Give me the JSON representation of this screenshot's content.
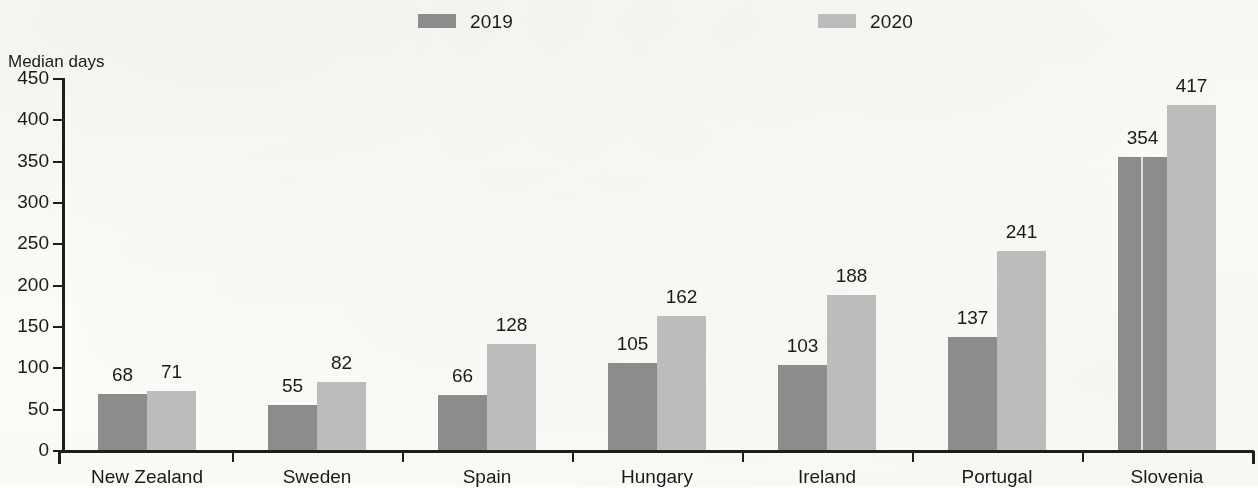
{
  "legend": {
    "entries": [
      {
        "label": "2019",
        "color": "#8c8c8c",
        "x": 418
      },
      {
        "label": "2020",
        "color": "#bcbcbc",
        "x": 818
      }
    ]
  },
  "axis": {
    "y_title": "Median days"
  },
  "chart_data": {
    "type": "bar",
    "title": "",
    "subtitle": "",
    "xlabel": "",
    "ylabel": "Median days",
    "ylim": [
      0,
      450
    ],
    "ytick_step": 50,
    "yticks": [
      "0",
      "50",
      "100",
      "150",
      "200",
      "250",
      "300",
      "350",
      "400",
      "450"
    ],
    "grid": false,
    "legend_position": "top",
    "categories": [
      "New Zealand",
      "Sweden",
      "Spain",
      "Hungary",
      "Ireland",
      "Portugal",
      "Slovenia"
    ],
    "series": [
      {
        "name": "2019",
        "color": "#8c8c8c",
        "values": [
          68,
          55,
          66,
          105,
          103,
          137,
          354
        ]
      },
      {
        "name": "2020",
        "color": "#bcbcbc",
        "values": [
          71,
          82,
          128,
          162,
          188,
          241,
          417
        ]
      }
    ]
  }
}
